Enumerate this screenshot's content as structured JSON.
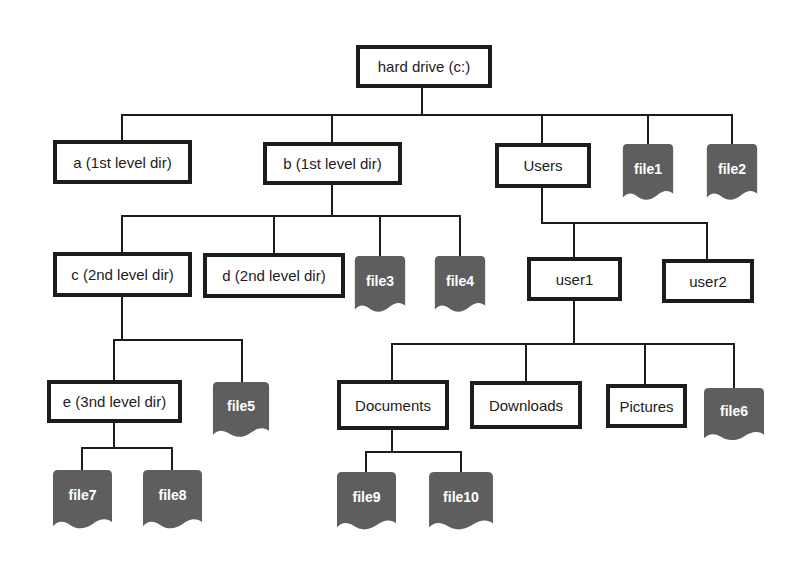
{
  "diagram": {
    "type": "file-system-tree"
  },
  "colors": {
    "background": "#ffffff",
    "line": "#1c1c1c",
    "box_border": "#1c1c1c",
    "box_fill": "#ffffff",
    "box_text": "#1c1c1c",
    "file_fill": "#5e5e5e",
    "file_text": "#ffffff"
  },
  "nodes": {
    "root": {
      "label": "hard drive (c:)",
      "type": "directory"
    },
    "a": {
      "label": "a (1st level dir)",
      "type": "directory"
    },
    "b": {
      "label": "b (1st level dir)",
      "type": "directory"
    },
    "users": {
      "label": "Users",
      "type": "directory"
    },
    "file1": {
      "label": "file1",
      "type": "file"
    },
    "file2": {
      "label": "file2",
      "type": "file"
    },
    "c": {
      "label": "c (2nd level dir)",
      "type": "directory"
    },
    "d": {
      "label": "d (2nd level dir)",
      "type": "directory"
    },
    "file3": {
      "label": "file3",
      "type": "file"
    },
    "file4": {
      "label": "file4",
      "type": "file"
    },
    "user1": {
      "label": "user1",
      "type": "directory"
    },
    "user2": {
      "label": "user2",
      "type": "directory"
    },
    "e": {
      "label": "e (3nd level dir)",
      "type": "directory"
    },
    "file5": {
      "label": "file5",
      "type": "file"
    },
    "documents": {
      "label": "Documents",
      "type": "directory"
    },
    "downloads": {
      "label": "Downloads",
      "type": "directory"
    },
    "pictures": {
      "label": "Pictures",
      "type": "directory"
    },
    "file6": {
      "label": "file6",
      "type": "file"
    },
    "file7": {
      "label": "file7",
      "type": "file"
    },
    "file8": {
      "label": "file8",
      "type": "file"
    },
    "file9": {
      "label": "file9",
      "type": "file"
    },
    "file10": {
      "label": "file10",
      "type": "file"
    }
  },
  "tree": {
    "label": "hard drive (c:)",
    "type": "directory",
    "children": [
      {
        "label": "a (1st level dir)",
        "type": "directory",
        "children": []
      },
      {
        "label": "b (1st level dir)",
        "type": "directory",
        "children": [
          {
            "label": "c (2nd level dir)",
            "type": "directory",
            "children": [
              {
                "label": "e (3nd level dir)",
                "type": "directory",
                "children": [
                  {
                    "label": "file7",
                    "type": "file"
                  },
                  {
                    "label": "file8",
                    "type": "file"
                  }
                ]
              },
              {
                "label": "file5",
                "type": "file"
              }
            ]
          },
          {
            "label": "d (2nd level dir)",
            "type": "directory",
            "children": []
          },
          {
            "label": "file3",
            "type": "file"
          },
          {
            "label": "file4",
            "type": "file"
          }
        ]
      },
      {
        "label": "Users",
        "type": "directory",
        "children": [
          {
            "label": "user1",
            "type": "directory",
            "children": [
              {
                "label": "Documents",
                "type": "directory",
                "children": [
                  {
                    "label": "file9",
                    "type": "file"
                  },
                  {
                    "label": "file10",
                    "type": "file"
                  }
                ]
              },
              {
                "label": "Downloads",
                "type": "directory",
                "children": []
              },
              {
                "label": "Pictures",
                "type": "directory",
                "children": []
              },
              {
                "label": "file6",
                "type": "file"
              }
            ]
          },
          {
            "label": "user2",
            "type": "directory",
            "children": []
          }
        ]
      },
      {
        "label": "file1",
        "type": "file"
      },
      {
        "label": "file2",
        "type": "file"
      }
    ]
  }
}
